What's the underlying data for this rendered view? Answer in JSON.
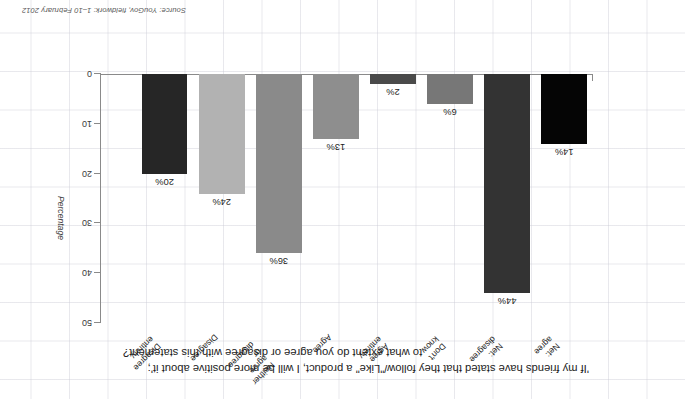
{
  "chart_data": {
    "type": "bar",
    "title": "'If my friends have stated that they follow/\"Like\" a product, I will be more positive about it';",
    "subtitle": "to what extent do you agree or disagree with this statement?",
    "xlabel": "",
    "ylabel": "Percentage",
    "ylim": [
      0,
      50
    ],
    "yticks": [
      "0",
      "10",
      "20",
      "30",
      "40",
      "50"
    ],
    "grid": true,
    "legend": "none",
    "orientation": "rotated-180",
    "source": "Source: YouGov, fieldwork: 1–10 February 2012",
    "categories": [
      "Net: agree",
      "Net: disagree",
      "Don't know",
      "Agree entirely",
      "Agree",
      "Neither agree or disagree",
      "Disagree",
      "Disagree entirely"
    ],
    "values": [
      14,
      44,
      6,
      2,
      13,
      36,
      24,
      20
    ],
    "value_labels": [
      "14%",
      "44%",
      "6%",
      "2%",
      "13%",
      "36%",
      "24%",
      "20%"
    ],
    "colors": [
      "#050505",
      "#333333",
      "#777777",
      "#4a4a4a",
      "#8e8e8e",
      "#8a8a8a",
      "#b2b2b2",
      "#262626"
    ]
  }
}
